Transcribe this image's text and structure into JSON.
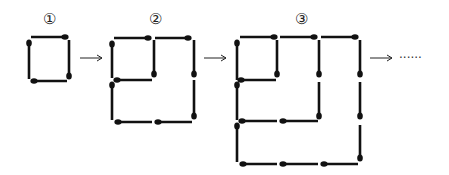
{
  "figure": {
    "labels": [
      "①",
      "②",
      "③"
    ],
    "continuation": "······",
    "figures": [
      {
        "label": "①",
        "sticks": [
          {
            "x1": 31,
            "y1": 37,
            "x2": 65,
            "y2": 37,
            "head": "end"
          },
          {
            "x1": 29,
            "y1": 43,
            "x2": 29,
            "y2": 79,
            "head": "start"
          },
          {
            "x1": 69,
            "y1": 40,
            "x2": 69,
            "y2": 76,
            "head": "end"
          },
          {
            "x1": 34,
            "y1": 81,
            "x2": 67,
            "y2": 81,
            "head": "start"
          }
        ]
      },
      {
        "label": "②",
        "sticks": [
          {
            "x1": 114,
            "y1": 38,
            "x2": 148,
            "y2": 38,
            "head": "end"
          },
          {
            "x1": 155,
            "y1": 38,
            "x2": 188,
            "y2": 38,
            "head": "end"
          },
          {
            "x1": 112,
            "y1": 44,
            "x2": 112,
            "y2": 78,
            "head": "start"
          },
          {
            "x1": 154,
            "y1": 40,
            "x2": 154,
            "y2": 74,
            "head": "end"
          },
          {
            "x1": 117,
            "y1": 80,
            "x2": 152,
            "y2": 80,
            "head": "start"
          },
          {
            "x1": 194,
            "y1": 40,
            "x2": 194,
            "y2": 74,
            "head": "end"
          },
          {
            "x1": 112,
            "y1": 85,
            "x2": 112,
            "y2": 120,
            "head": "start"
          },
          {
            "x1": 194,
            "y1": 80,
            "x2": 194,
            "y2": 116,
            "head": "end"
          },
          {
            "x1": 118,
            "y1": 122,
            "x2": 152,
            "y2": 122,
            "head": "start"
          },
          {
            "x1": 158,
            "y1": 122,
            "x2": 192,
            "y2": 122,
            "head": "start"
          }
        ]
      },
      {
        "label": "③",
        "sticks": [
          {
            "x1": 240,
            "y1": 37,
            "x2": 274,
            "y2": 37,
            "head": "end"
          },
          {
            "x1": 280,
            "y1": 37,
            "x2": 314,
            "y2": 37,
            "head": "end"
          },
          {
            "x1": 321,
            "y1": 37,
            "x2": 355,
            "y2": 37,
            "head": "end"
          },
          {
            "x1": 237,
            "y1": 43,
            "x2": 237,
            "y2": 80,
            "head": "start"
          },
          {
            "x1": 237,
            "y1": 85,
            "x2": 237,
            "y2": 120,
            "head": "start"
          },
          {
            "x1": 237,
            "y1": 126,
            "x2": 237,
            "y2": 162,
            "head": "start"
          },
          {
            "x1": 277,
            "y1": 40,
            "x2": 277,
            "y2": 74,
            "head": "end"
          },
          {
            "x1": 241,
            "y1": 80,
            "x2": 276,
            "y2": 80,
            "head": "start"
          },
          {
            "x1": 319,
            "y1": 40,
            "x2": 319,
            "y2": 74,
            "head": "end"
          },
          {
            "x1": 319,
            "y1": 82,
            "x2": 319,
            "y2": 116,
            "head": "end"
          },
          {
            "x1": 242,
            "y1": 121,
            "x2": 277,
            "y2": 121,
            "head": "start"
          },
          {
            "x1": 283,
            "y1": 121,
            "x2": 318,
            "y2": 121,
            "head": "start"
          },
          {
            "x1": 360,
            "y1": 40,
            "x2": 360,
            "y2": 74,
            "head": "end"
          },
          {
            "x1": 360,
            "y1": 82,
            "x2": 360,
            "y2": 116,
            "head": "end"
          },
          {
            "x1": 360,
            "y1": 125,
            "x2": 360,
            "y2": 158,
            "head": "end"
          },
          {
            "x1": 243,
            "y1": 164,
            "x2": 277,
            "y2": 164,
            "head": "start"
          },
          {
            "x1": 283,
            "y1": 164,
            "x2": 318,
            "y2": 164,
            "head": "start"
          },
          {
            "x1": 324,
            "y1": 164,
            "x2": 358,
            "y2": 164,
            "head": "start"
          }
        ]
      }
    ],
    "label_positions": [
      {
        "x": 49,
        "y": 24
      },
      {
        "x": 155,
        "y": 24
      },
      {
        "x": 301,
        "y": 24
      }
    ],
    "arrows": [
      {
        "x1": 80,
        "x2": 102,
        "y": 58
      },
      {
        "x1": 204,
        "x2": 226,
        "y": 58
      },
      {
        "x1": 370,
        "x2": 392,
        "y": 58
      }
    ],
    "dots_position": {
      "x": 399,
      "y": 62
    }
  }
}
